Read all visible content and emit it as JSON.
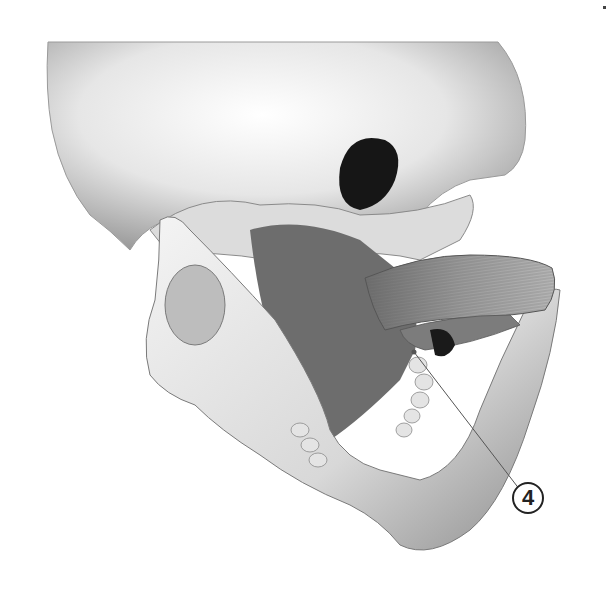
{
  "figure": {
    "callouts": [
      {
        "label": "4",
        "target_x": 414,
        "target_y": 352,
        "label_x": 528,
        "label_y": 498
      }
    ],
    "colors": {
      "background": "#ffffff",
      "bone_light": "#f2f2f2",
      "bone_mid": "#c9c9c9",
      "bone_shadow": "#7a7a7a",
      "cavity_dark": "#1a1a1a",
      "muscle": "#8a8a8a",
      "leader_line": "#555555",
      "label_stroke": "#222222"
    }
  }
}
